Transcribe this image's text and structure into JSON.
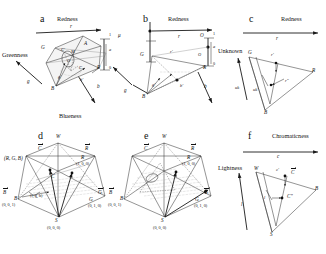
{
  "figure": {
    "caption_letters": [
      "a",
      "b",
      "c",
      "d",
      "e",
      "f"
    ],
    "background_color": "#ffffff",
    "line_color": "#2a2a2a",
    "type": "scientific-diagram"
  },
  "panel_a": {
    "letter": "a",
    "axis_redness": "Redness",
    "axis_greenness": "Greenness",
    "axis_blueness": "Blueness",
    "labels": {
      "r": "r",
      "G": "G",
      "A": "A",
      "C_prime": "C'",
      "M": "M",
      "O": "O",
      "C": "C",
      "R": "R",
      "B": "B",
      "g": "g",
      "g_prime": "g'",
      "b_prime": "b'",
      "b": "b",
      "one_top": "1",
      "mu": "μ",
      "a": "a",
      "zero": "0"
    }
  },
  "panel_b": {
    "letter": "b",
    "axis_redness": "Redness",
    "labels": {
      "r_o": "r",
      "r_o_prime": "r'",
      "O_a": "O",
      "O_b": "O",
      "G_o": "G",
      "R_o": "R",
      "B_o": "B",
      "g_o": "g",
      "g_o_prime": "g'",
      "b_o_prime": "b'",
      "b_o": "b",
      "one": "1",
      "a": "a",
      "zero": "0"
    }
  },
  "panel_c": {
    "letter": "c",
    "axis_redness": "Redness",
    "axis_unknown": "Unknown",
    "labels": {
      "r_o": "r",
      "r_o_prime": "r'",
      "r_dprime": "r\"",
      "G_o": "G",
      "R_o": "R",
      "B_o": "B",
      "uk": "uk",
      "uk_prime": "uk'"
    }
  },
  "panel_d": {
    "letter": "d",
    "labels": {
      "W": "W",
      "C_vec": "C",
      "R_vec": "R",
      "B_vec": "B",
      "G_vec": "G",
      "R": "R",
      "G": "G",
      "B": "B",
      "S": "S",
      "C": "C",
      "rgb_tuple": "(R, G, B)",
      "R_coord": "(1, 0, 0)",
      "G_coord": "(0, 1, 0)",
      "B_coord": "(0, 0, 1)",
      "S_coord": "(0, 0, 0)",
      "inner_coord": "(r, g, b)"
    }
  },
  "panel_e": {
    "letter": "e",
    "labels": {
      "W": "W",
      "C_vec": "C",
      "R_vec": "R",
      "B_vec": "B",
      "G_vec": "G",
      "R": "R",
      "G": "G",
      "B": "B",
      "S": "S",
      "R_coord": "(1, 0, 0)",
      "G_coord": "(0, 1, 0)",
      "B_coord": "(0, 0, 1)",
      "S_coord": "(0, 0, 0)"
    }
  },
  "panel_f": {
    "letter": "f",
    "axis_chromaticness": "Chromaticness",
    "axis_lightness": "Lightness",
    "labels": {
      "c_o": "c",
      "c_o_prime": "c'",
      "C_vec": "C",
      "C_dprime": "C\"",
      "W": "W",
      "B": "B",
      "S": "S",
      "l": "l",
      "l_o": "l"
    }
  }
}
